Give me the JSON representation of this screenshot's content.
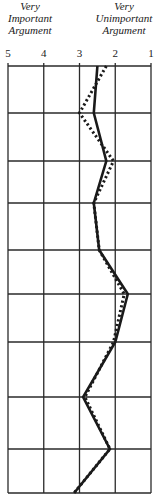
{
  "header": {
    "left": [
      "Very",
      "Important",
      "Argument"
    ],
    "right": [
      "Very",
      "Unimportant",
      "Argument"
    ]
  },
  "colors": {
    "ink": "#1a1a1a",
    "grid": "#2a2a2a",
    "background": "#ffffff"
  },
  "chart_data": {
    "type": "line",
    "orientation": "vertical-profile",
    "title": "",
    "xlabel": "",
    "ylabel": "",
    "x_axis": {
      "ticks": [
        5,
        4,
        3,
        2,
        1
      ],
      "tick_labels": [
        "5",
        "4",
        "3",
        "2",
        "1"
      ],
      "range": [
        5,
        1
      ],
      "left_label": "Very Important Argument",
      "right_label": "Very Unimportant Argument"
    },
    "grid": true,
    "rows": 10,
    "legend": null,
    "series": [
      {
        "name": "solid",
        "style": "solid",
        "values": [
          2.5,
          2.6,
          2.25,
          2.6,
          2.45,
          1.65,
          2.0,
          2.9,
          2.15,
          3.15
        ]
      },
      {
        "name": "dotted",
        "style": "dotted",
        "values": [
          2.25,
          3.0,
          2.05,
          2.6,
          2.45,
          1.75,
          2.05,
          2.85,
          2.15,
          3.15
        ]
      }
    ]
  }
}
